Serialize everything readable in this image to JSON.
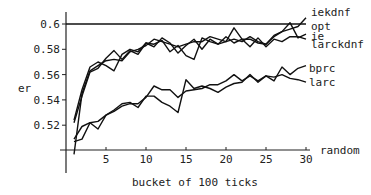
{
  "chart_data": {
    "type": "line",
    "title": "",
    "xlabel": "bucket of 100 ticks",
    "ylabel": "er",
    "xlim": [
      0,
      30
    ],
    "ylim": [
      0.5,
      0.6
    ],
    "xticks": [
      5,
      10,
      15,
      20,
      25,
      30
    ],
    "yticks": [
      0.52,
      0.54,
      0.56,
      0.58,
      0.6
    ],
    "ytick_labels": [
      "0.52",
      "0.54",
      "0.56",
      "0.58",
      "0.6"
    ],
    "xtick_labels": [
      "5",
      "10",
      "15",
      "20",
      "25",
      "30"
    ],
    "grid": false,
    "legend_position": "right, inline labels at line ends",
    "x": [
      1,
      2,
      3,
      4,
      5,
      6,
      7,
      8,
      9,
      10,
      11,
      12,
      13,
      14,
      15,
      16,
      17,
      18,
      19,
      20,
      21,
      22,
      23,
      24,
      25,
      26,
      27,
      28,
      29,
      30
    ],
    "series": [
      {
        "name": "iekdnf",
        "values": [
          0.497,
          0.545,
          0.563,
          0.567,
          0.571,
          0.572,
          0.571,
          0.578,
          0.58,
          0.583,
          0.588,
          0.586,
          0.584,
          0.582,
          0.584,
          0.586,
          0.586,
          0.59,
          0.588,
          0.586,
          0.588,
          0.586,
          0.59,
          0.586,
          0.584,
          0.59,
          0.594,
          0.596,
          0.598,
          0.605
        ]
      },
      {
        "name": "opt",
        "values": [
          0.6,
          0.6,
          0.6,
          0.6,
          0.6,
          0.6,
          0.6,
          0.6,
          0.6,
          0.6,
          0.6,
          0.6,
          0.6,
          0.6,
          0.6,
          0.6,
          0.6,
          0.6,
          0.6,
          0.6,
          0.6,
          0.6,
          0.6,
          0.6,
          0.6,
          0.6,
          0.6,
          0.6,
          0.6,
          0.6
        ]
      },
      {
        "name": "ie",
        "values": [
          0.522,
          0.543,
          0.562,
          0.565,
          0.573,
          0.579,
          0.572,
          0.579,
          0.576,
          0.585,
          0.582,
          0.589,
          0.585,
          0.577,
          0.583,
          0.588,
          0.58,
          0.588,
          0.584,
          0.586,
          0.597,
          0.588,
          0.588,
          0.585,
          0.584,
          0.591,
          0.594,
          0.601,
          0.589,
          0.592
        ]
      },
      {
        "name": "larckdnf",
        "values": [
          0.524,
          0.548,
          0.566,
          0.57,
          0.567,
          0.563,
          0.576,
          0.58,
          0.578,
          0.585,
          0.584,
          0.587,
          0.578,
          0.583,
          0.575,
          0.572,
          0.589,
          0.586,
          0.584,
          0.59,
          0.585,
          0.588,
          0.582,
          0.589,
          0.582,
          0.588,
          0.586,
          0.59,
          0.59,
          0.588
        ]
      },
      {
        "name": "bprc",
        "values": [
          0.509,
          0.519,
          0.522,
          0.517,
          0.528,
          0.531,
          0.535,
          0.537,
          0.537,
          0.542,
          0.551,
          0.548,
          0.548,
          0.542,
          0.547,
          0.548,
          0.549,
          0.552,
          0.552,
          0.555,
          0.56,
          0.555,
          0.559,
          0.555,
          0.559,
          0.555,
          0.566,
          0.56,
          0.565,
          0.567
        ]
      },
      {
        "name": "larc",
        "values": [
          0.507,
          0.509,
          0.522,
          0.523,
          0.528,
          0.532,
          0.537,
          0.538,
          0.534,
          0.543,
          0.543,
          0.538,
          0.535,
          0.53,
          0.556,
          0.549,
          0.551,
          0.549,
          0.546,
          0.55,
          0.553,
          0.554,
          0.56,
          0.554,
          0.559,
          0.558,
          0.56,
          0.557,
          0.556,
          0.554
        ]
      }
    ],
    "annotations": [
      "random"
    ]
  },
  "labels": {
    "ylabel": "er",
    "xlabel": "bucket of 100 ticks",
    "random": "random",
    "legend": [
      "iekdnf",
      "opt",
      "ie",
      "larckdnf",
      "bprc",
      "larc"
    ]
  },
  "colors": {
    "line": "#111111",
    "text": "#222222",
    "background": "#ffffff"
  }
}
